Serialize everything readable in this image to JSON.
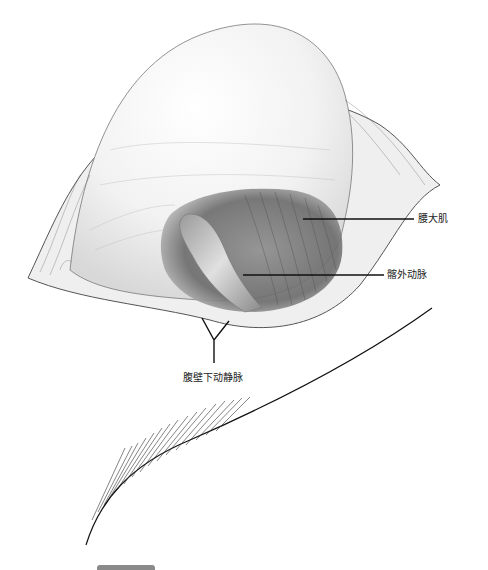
{
  "figure": {
    "labels": [
      {
        "id": "psoas",
        "text": "腰大肌"
      },
      {
        "id": "external_iliac_artery",
        "text": "髂外动脉"
      },
      {
        "id": "inferior_epigastric_vessels",
        "text": "腹壁下动静脉"
      }
    ]
  },
  "colors": {
    "ink": "#1a1a1a",
    "shade_dark": "#6e6e6e",
    "shade_mid": "#a8a8a8",
    "shade_light": "#e6e6e6",
    "background": "#ffffff"
  }
}
